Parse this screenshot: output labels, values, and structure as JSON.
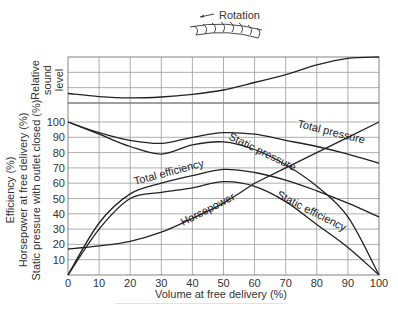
{
  "chart_data": [
    {
      "type": "line",
      "title": "",
      "panel": "top",
      "ylabel": "Relative sound level",
      "xlabel": "",
      "x": [
        0,
        10,
        20,
        30,
        40,
        50,
        60,
        70,
        80,
        90,
        100
      ],
      "series": [
        {
          "name": "Relative sound level",
          "values": [
            0.17,
            0.1,
            0.07,
            0.09,
            0.15,
            0.25,
            0.42,
            0.6,
            0.82,
            0.97,
            1.0
          ]
        }
      ],
      "ylim": [
        0,
        1
      ],
      "grid": true
    },
    {
      "type": "line",
      "title": "",
      "panel": "bottom",
      "xlabel": "Volume at free delivery (%)",
      "ylabel_lines": [
        "Efficiency (%)",
        "Horsepower at free delivery (%)",
        "Static pressure with outlet closed (%)"
      ],
      "x": [
        0,
        10,
        20,
        30,
        40,
        50,
        60,
        70,
        80,
        90,
        100
      ],
      "xticks": [
        "0",
        "10",
        "20",
        "30",
        "40",
        "50",
        "60",
        "70",
        "80",
        "90",
        "100"
      ],
      "yticks": [
        "10",
        "20",
        "30",
        "40",
        "50",
        "60",
        "70",
        "80",
        "90",
        "100"
      ],
      "xlim": [
        0,
        100
      ],
      "ylim": [
        0,
        100
      ],
      "grid": true,
      "series": [
        {
          "name": "Total pressure",
          "values": [
            100,
            93,
            88,
            86,
            90,
            93,
            92,
            88,
            84,
            79,
            73
          ]
        },
        {
          "name": "Static pressure",
          "values": [
            100,
            92,
            84,
            79,
            85,
            87,
            82,
            72,
            58,
            38,
            0
          ]
        },
        {
          "name": "Total efficiency",
          "values": [
            0,
            34,
            53,
            60,
            65,
            69,
            67,
            62,
            55,
            47,
            38
          ]
        },
        {
          "name": "Static efficiency",
          "values": [
            0,
            30,
            50,
            54,
            57,
            61,
            58,
            48,
            33,
            18,
            0
          ]
        },
        {
          "name": "Horsepower",
          "values": [
            17,
            19,
            22,
            28,
            37,
            47,
            60,
            70,
            80,
            90,
            100
          ]
        }
      ]
    }
  ],
  "diagram": {
    "rotation_label": "Rotation"
  },
  "labels": {
    "sound_ylabel": [
      "Relative",
      "sound",
      "level"
    ],
    "main_ylabel": [
      "Efficiency (%)",
      "Horsepower at free delivery (%)",
      "Static pressure with outlet closed (%)"
    ],
    "xlabel": "Volume at free delivery (%)",
    "curve_total_pressure": "Total pressure",
    "curve_static_pressure": "Static pressure",
    "curve_total_efficiency": "Total efficiency",
    "curve_static_efficiency": "Static efficiency",
    "curve_horsepower": "Horsepower"
  }
}
